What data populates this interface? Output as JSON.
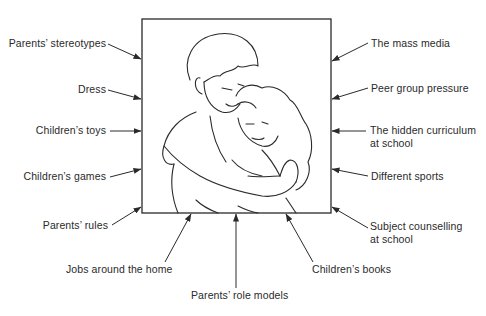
{
  "figure": {
    "type": "influence-diagram",
    "center_image": "Illustration of an adult hugging a child",
    "colors": {
      "ink": "#2a2a2a",
      "background": "#ffffff"
    }
  },
  "labels": {
    "left": [
      {
        "id": "parents-stereotypes",
        "text": "Parents’ stereotypes"
      },
      {
        "id": "dress",
        "text": "Dress"
      },
      {
        "id": "childrens-toys",
        "text": "Children’s toys"
      },
      {
        "id": "childrens-games",
        "text": "Children’s games"
      },
      {
        "id": "parents-rules",
        "text": "Parents’ rules"
      }
    ],
    "right": [
      {
        "id": "mass-media",
        "text": "The mass media"
      },
      {
        "id": "peer-group-pressure",
        "text": "Peer group pressure"
      },
      {
        "id": "hidden-curriculum",
        "line1": "The hidden curriculum",
        "line2": "at school"
      },
      {
        "id": "different-sports",
        "text": "Different sports"
      },
      {
        "id": "subject-counselling",
        "line1": "Subject counselling",
        "line2": "at school"
      }
    ],
    "bottom": [
      {
        "id": "jobs-around-home",
        "text": "Jobs around the home"
      },
      {
        "id": "parents-role-models",
        "text": "Parents’ role models"
      },
      {
        "id": "childrens-books",
        "text": "Children’s books"
      }
    ]
  }
}
